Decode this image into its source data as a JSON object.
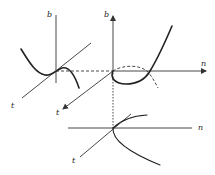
{
  "diagram": {
    "type": "bifurcation-projection",
    "panels": [
      {
        "id": "left",
        "axes": {
          "vertical": "b",
          "diagonal": "t"
        }
      },
      {
        "id": "middle",
        "axes": {
          "vertical": "b",
          "horizontal": "n",
          "diagonal": "t"
        }
      },
      {
        "id": "bottom",
        "axes": {
          "horizontal": "n",
          "diagonal": "t"
        }
      }
    ],
    "labels": {
      "left_b": "b",
      "left_t": "t",
      "mid_b": "b",
      "mid_n": "n",
      "mid_t": "t",
      "bot_n": "n",
      "bot_t": "t"
    },
    "colors": {
      "ink": "#222222",
      "background": "#ffffff"
    }
  }
}
